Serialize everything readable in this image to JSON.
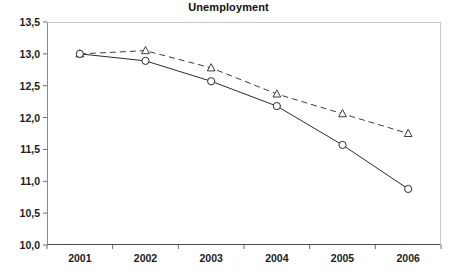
{
  "chart_data": {
    "type": "line",
    "title": "Unemployment",
    "xlabel": "",
    "ylabel": "",
    "x": [
      "2001",
      "2002",
      "2003",
      "2004",
      "2005",
      "2006"
    ],
    "categories": [
      "2001",
      "2002",
      "2003",
      "2004",
      "2005",
      "2006"
    ],
    "ylim": [
      10.0,
      13.5
    ],
    "yticks": [
      10.0,
      10.5,
      11.0,
      11.5,
      12.0,
      12.5,
      13.0,
      13.5
    ],
    "ytick_labels": [
      "10,0",
      "10,5",
      "11,0",
      "11,5",
      "12,0",
      "12,5",
      "13,0",
      "13,5"
    ],
    "xtick_labels": [
      "2001",
      "2002",
      "2003",
      "2004",
      "2005",
      "2006"
    ],
    "grid": false,
    "legend": "none",
    "decimal_separator": ",",
    "series": [
      {
        "name": "dashed-triangle-series",
        "line_style": "dashed",
        "marker": "triangle-open",
        "color": "#3a3a3a",
        "values": [
          13.0,
          13.05,
          12.78,
          12.37,
          12.06,
          11.75
        ]
      },
      {
        "name": "solid-circle-series",
        "line_style": "solid",
        "marker": "circle-open",
        "color": "#2b2b2b",
        "values": [
          13.0,
          12.89,
          12.57,
          12.18,
          11.57,
          10.88
        ]
      }
    ]
  }
}
